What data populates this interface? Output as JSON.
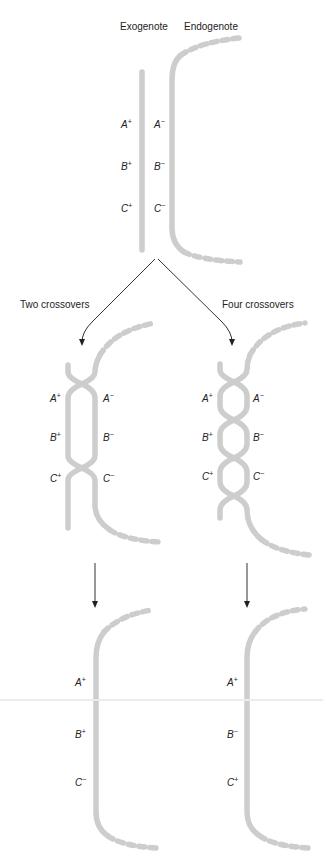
{
  "labels": {
    "exogenote": "Exogenote",
    "endogenote": "Endogenote",
    "two_crossovers": "Two crossovers",
    "four_crossovers": "Four crossovers"
  },
  "panel_top": {
    "exogenote_genes": [
      {
        "letter": "A",
        "sign": "+"
      },
      {
        "letter": "B",
        "sign": "+"
      },
      {
        "letter": "C",
        "sign": "+"
      }
    ],
    "endogenote_genes": [
      {
        "letter": "A",
        "sign": "−"
      },
      {
        "letter": "B",
        "sign": "−"
      },
      {
        "letter": "C",
        "sign": "−"
      }
    ]
  },
  "panel_two_crossovers": {
    "left_genes": [
      {
        "letter": "A",
        "sign": "+"
      },
      {
        "letter": "B",
        "sign": "+"
      },
      {
        "letter": "C",
        "sign": "+"
      }
    ],
    "right_genes": [
      {
        "letter": "A",
        "sign": "−"
      },
      {
        "letter": "B",
        "sign": "−"
      },
      {
        "letter": "C",
        "sign": "−"
      }
    ],
    "result_genes": [
      {
        "letter": "A",
        "sign": "+"
      },
      {
        "letter": "B",
        "sign": "+"
      },
      {
        "letter": "C",
        "sign": "−"
      }
    ]
  },
  "panel_four_crossovers": {
    "left_genes": [
      {
        "letter": "A",
        "sign": "+"
      },
      {
        "letter": "B",
        "sign": "+"
      },
      {
        "letter": "C",
        "sign": "+"
      }
    ],
    "right_genes": [
      {
        "letter": "A",
        "sign": "−"
      },
      {
        "letter": "B",
        "sign": "−"
      },
      {
        "letter": "C",
        "sign": "−"
      }
    ],
    "result_genes": [
      {
        "letter": "A",
        "sign": "+"
      },
      {
        "letter": "B",
        "sign": "−"
      },
      {
        "letter": "C",
        "sign": "+"
      }
    ]
  },
  "colors": {
    "strand": "#cdcdcd",
    "arrow": "#333333",
    "text": "#222222"
  }
}
